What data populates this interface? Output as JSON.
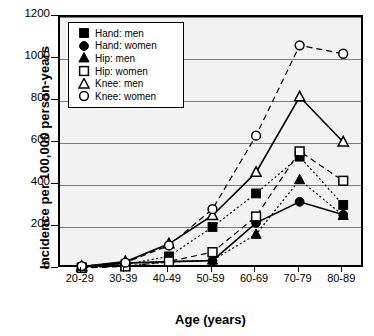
{
  "chart_data": {
    "type": "line",
    "title": "",
    "xlabel": "Age (years)",
    "ylabel": "Incidence per 100,000 person-years",
    "categories": [
      "20-29",
      "30-39",
      "40-49",
      "50-59",
      "60-69",
      "70-79",
      "80-89"
    ],
    "ylim": [
      0,
      1200
    ],
    "yticks": [
      0,
      200,
      400,
      600,
      800,
      1000,
      1200
    ],
    "grid": true,
    "legend_position": "top-left",
    "series": [
      {
        "name": "Hand: men",
        "marker": "filled-square",
        "line": "dotted",
        "values": [
          8,
          22,
          60,
          200,
          360,
          535,
          305
        ]
      },
      {
        "name": "Hand: women",
        "marker": "filled-circle",
        "line": "solid",
        "values": [
          10,
          28,
          35,
          40,
          220,
          320,
          258
        ]
      },
      {
        "name": "Hip: men",
        "marker": "filled-triangle",
        "line": "dotted",
        "values": [
          6,
          14,
          33,
          42,
          165,
          425,
          255
        ]
      },
      {
        "name": "Hip: women",
        "marker": "open-square",
        "line": "dashed",
        "values": [
          5,
          12,
          36,
          80,
          250,
          560,
          420
        ]
      },
      {
        "name": "Knee: men",
        "marker": "open-triangle",
        "line": "solid",
        "values": [
          12,
          35,
          120,
          255,
          460,
          820,
          605
        ]
      },
      {
        "name": "Knee: women",
        "marker": "open-circle",
        "line": "dashed",
        "values": [
          14,
          30,
          112,
          285,
          635,
          1065,
          1025
        ]
      }
    ]
  },
  "colors": {
    "plot_background": "#f2f2f2",
    "grid": "#7d7d7d",
    "axis": "#000000",
    "series": "#000000"
  }
}
